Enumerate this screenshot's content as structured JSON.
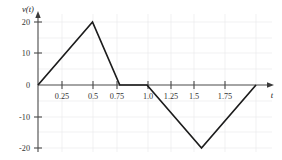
{
  "chart_data": {
    "type": "line",
    "title": "",
    "subtitle": "",
    "xlabel": "t",
    "ylabel": "v(t)",
    "xlim": [
      0,
      2.0
    ],
    "ylim": [
      -25,
      25
    ],
    "grid": true,
    "legend": null,
    "x_ticks": [
      0.25,
      0.5,
      0.75,
      1.0,
      1.25,
      1.5,
      1.75
    ],
    "x_tick_labels": [
      "0.25",
      "0.5",
      "0.75",
      "1.0",
      "1.25",
      "1.5",
      "1.75"
    ],
    "y_ticks": [
      20,
      10,
      0,
      -10,
      -20
    ],
    "y_tick_labels": [
      "20",
      "10",
      "0",
      "-10",
      "-20"
    ],
    "series": [
      {
        "name": "v(t)",
        "color": "#1c1c1c",
        "x": [
          0,
          0.5,
          0.75,
          1.0,
          1.5,
          2.0
        ],
        "values": [
          0,
          20,
          0,
          0,
          -20,
          0
        ]
      }
    ],
    "annotations": []
  },
  "axis": {
    "y_label_text": "v(t)",
    "x_label_text": "t"
  }
}
